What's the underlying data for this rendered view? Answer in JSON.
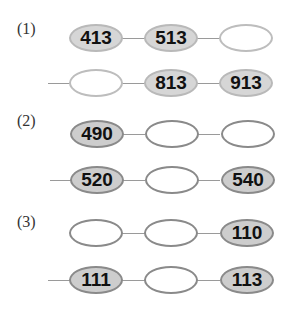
{
  "sections": [
    {
      "label": "(1)",
      "rows": [
        [
          "413",
          "513",
          ""
        ],
        [
          "",
          "813",
          "913"
        ]
      ]
    },
    {
      "label": "(2)",
      "rows": [
        [
          "490",
          "",
          ""
        ],
        [
          "520",
          "",
          "540"
        ]
      ]
    },
    {
      "label": "(3)",
      "rows": [
        [
          "",
          "",
          "110"
        ],
        [
          "111",
          "",
          "113"
        ]
      ]
    }
  ],
  "colors": {
    "filled_light": "#d6d6d6",
    "filled_dark": "#cdcdcd",
    "border_light": "#bdbdbd",
    "border_dark": "#8a8a8a",
    "connector": "#9a9a9a"
  }
}
